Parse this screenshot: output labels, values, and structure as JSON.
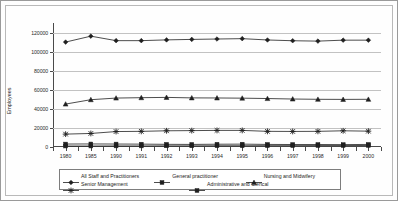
{
  "chart_data": {
    "type": "line",
    "title": "",
    "xlabel": "",
    "ylabel": "Employees",
    "ylim": [
      0,
      130000
    ],
    "yticks": [
      0,
      20000,
      40000,
      60000,
      80000,
      100000,
      120000
    ],
    "ytick_labels": [
      "0",
      "20000",
      "40000",
      "60000",
      "80000",
      "100000",
      "120000"
    ],
    "grid": true,
    "legend_position": "bottom",
    "categories": [
      "1980",
      "1985",
      "1990",
      "1991",
      "1992",
      "1993",
      "1994",
      "1995",
      "1996",
      "1997",
      "1998",
      "1999",
      "2000"
    ],
    "series": [
      {
        "name": "All Staff and Practitioners",
        "marker": "diamond",
        "values": [
          110000,
          116200,
          111500,
          111500,
          112300,
          112800,
          113200,
          113600,
          112200,
          111400,
          111000,
          112000,
          112000
        ]
      },
      {
        "name": "General practitioner",
        "marker": "square",
        "values": [
          1000,
          1000,
          1100,
          1100,
          1200,
          1200,
          1300,
          1300,
          1400,
          1400,
          1500,
          1500,
          1600
        ]
      },
      {
        "name": "Nursing and Midwifery",
        "marker": "triangle",
        "values": [
          45000,
          49600,
          51300,
          51700,
          52000,
          51500,
          51400,
          51200,
          50800,
          50300,
          50000,
          49900,
          50000
        ]
      },
      {
        "name": "Senior Management",
        "marker": "cross",
        "values": [
          13500,
          14200,
          16200,
          16400,
          17000,
          17200,
          17400,
          17400,
          16400,
          16300,
          16400,
          17000,
          16600
        ]
      },
      {
        "name": "Administrative and Clerical",
        "marker": "square",
        "values": [
          3100,
          3200,
          3100,
          3000,
          2800,
          2700,
          2900,
          3000,
          2700,
          2600,
          2600,
          2500,
          2700
        ]
      }
    ]
  }
}
